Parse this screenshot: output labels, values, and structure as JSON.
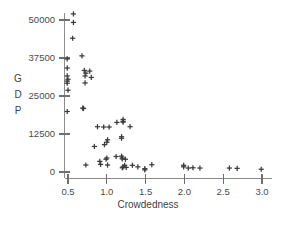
{
  "chart_data": {
    "type": "scatter",
    "title": "",
    "xlabel": "Crowdedness",
    "ylabel": "GDP",
    "ylabel_chars": [
      "G",
      "D",
      "P"
    ],
    "xlim": [
      0.42,
      3.12
    ],
    "ylim": [
      -2000,
      54000
    ],
    "grid": false,
    "legend": false,
    "marker_style": "plus",
    "marker_color": "#3b3b3b",
    "axis_color": "#8c8c8c",
    "xticks": [
      0.5,
      1.0,
      1.5,
      2.0,
      2.5,
      3.0
    ],
    "xtick_labels": [
      "0.5",
      "1.0",
      "1.5",
      "2.0",
      "2.5",
      "3.0"
    ],
    "yticks": [
      0,
      12500,
      25000,
      37500,
      50000
    ],
    "ytick_labels": [
      "0",
      "12500",
      "25000",
      "37500",
      "50000"
    ],
    "x": [
      0.57,
      0.57,
      0.56,
      0.68,
      0.49,
      0.49,
      0.49,
      0.5,
      0.49,
      0.49,
      0.5,
      0.71,
      0.73,
      0.72,
      0.78,
      0.8,
      0.72,
      0.49,
      0.69,
      0.7,
      0.88,
      0.96,
      1.03,
      1.13,
      1.21,
      1.21,
      1.21,
      1.3,
      1.01,
      1.19,
      1.19,
      0.84,
      0.97,
      1.0,
      1.19,
      1.2,
      1.2,
      1.24,
      0.91,
      0.99,
      1.0,
      1.12,
      0.73,
      0.92,
      1.01,
      1.2,
      1.21,
      1.23,
      1.25,
      1.33,
      1.4,
      1.49,
      1.49,
      1.58,
      1.99,
      1.99,
      2.05,
      2.11,
      2.2,
      2.58,
      2.68,
      2.99
    ],
    "y": [
      52000,
      49200,
      44000,
      38200,
      37200,
      34200,
      31600,
      30500,
      29900,
      29200,
      26900,
      33400,
      32500,
      31600,
      33200,
      31100,
      29300,
      19900,
      21000,
      20900,
      14900,
      14800,
      14800,
      16300,
      17300,
      16700,
      16400,
      14900,
      10600,
      11600,
      11100,
      8400,
      9000,
      9800,
      5200,
      4600,
      4300,
      4200,
      3500,
      4200,
      4600,
      5100,
      2300,
      2500,
      2300,
      1400,
      1700,
      2200,
      1500,
      2200,
      1700,
      1100,
      700,
      2400,
      2200,
      1700,
      1300,
      1400,
      1300,
      1300,
      1200,
      900
    ]
  }
}
